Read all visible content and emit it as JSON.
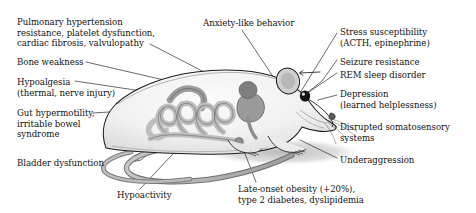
{
  "figure": {
    "background_color": "#ffffff",
    "text_color": "#131313",
    "leader_line_color": "#2b2b2b",
    "body_fill": "#f2f2f2",
    "body_outline": "#1a1a1a",
    "organ_fill": "#b9b9b9",
    "organ_dark_fill": "#8d8d8d",
    "shadow_fill": "#cfcfcf",
    "eye_fill": "#111111"
  },
  "labels": {
    "left": [
      {
        "id": "pulmonary",
        "text": "Pulmonary hypertension\nresistance, platelet dysfunction,\ncardiac fibrosis, valvulopathy",
        "anchor": "thorax / heart"
      },
      {
        "id": "bone",
        "text": "Bone weakness",
        "anchor": "skeleton"
      },
      {
        "id": "hypoalgesia",
        "text": "Hypoalgesia\n(thermal, nerve injury)",
        "anchor": "body"
      },
      {
        "id": "gut",
        "text": "Gut hypermotility,\nirritable bowel\nsyndrome",
        "anchor": "intestines"
      },
      {
        "id": "bladder",
        "text": "Bladder dysfunction",
        "anchor": "bladder"
      }
    ],
    "top": [
      {
        "id": "anxiety",
        "text": "Anxiety-like behavior",
        "anchor": "brain / head"
      }
    ],
    "right": [
      {
        "id": "stress",
        "text": "Stress susceptibility\n(ACTH, epinephrine)",
        "anchor": "head"
      },
      {
        "id": "seizure",
        "text": "Seizure resistance",
        "anchor": "head"
      },
      {
        "id": "rem",
        "text": "REM sleep disorder",
        "anchor": "head"
      },
      {
        "id": "depression",
        "text": "Depression\n(learned helplessness)",
        "anchor": "snout"
      },
      {
        "id": "somatosensory",
        "text": "Disrupted somatosensory\nsystems",
        "anchor": "whiskers / snout"
      },
      {
        "id": "underaggression",
        "text": "Underaggression",
        "anchor": "forelimb region"
      }
    ],
    "bottom": [
      {
        "id": "hypoactivity",
        "text": "Hypoactivity",
        "anchor": "hindlimb / tail"
      },
      {
        "id": "obesity",
        "text": "Late-onset obesity (+20%),\ntype 2 diabetes, dyslipidemia",
        "anchor": "abdomen"
      }
    ]
  }
}
